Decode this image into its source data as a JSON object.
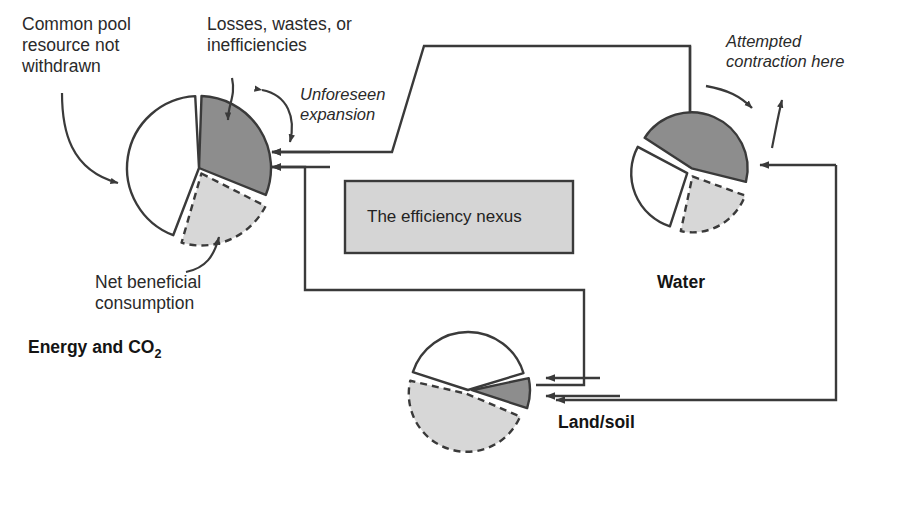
{
  "diagram": {
    "title_box": {
      "label": "The efficiency nexus"
    },
    "annotations": {
      "common_pool": "Common pool\nresource not\nwithdrawn",
      "losses": "Losses, wastes, or\ninefficiencies",
      "unforeseen": "Unforeseen\nexpansion",
      "net_beneficial": "Net beneficial\nconsumption",
      "attempted": "Attempted\ncontraction here"
    },
    "pies": [
      {
        "id": "energy",
        "label_main": "Energy and CO",
        "label_sub": "2",
        "center": [
          199,
          168
        ],
        "radius": 72,
        "slices": [
          {
            "name": "losses-wastes-inefficiencies",
            "fill": "#8d8d8d",
            "stroke": "solid",
            "start_deg": 2,
            "end_deg": 112,
            "explode": 0
          },
          {
            "name": "net-beneficial-consumption",
            "fill": "#d7d7d7",
            "stroke": "dashed",
            "start_deg": 117,
            "end_deg": 196,
            "explode": 6
          },
          {
            "name": "common-pool-not-withdrawn",
            "fill": "#ffffff",
            "stroke": "solid",
            "start_deg": 201,
            "end_deg": 357,
            "explode": 0
          }
        ]
      },
      {
        "id": "water",
        "label_main": "Water",
        "label_sub": "",
        "center": [
          690,
          172
        ],
        "radius": 56,
        "slices": [
          {
            "name": "losses-wastes-inefficiencies",
            "fill": "#8d8d8d",
            "stroke": "solid",
            "start_deg": 303,
            "end_deg": 104,
            "explode": 4
          },
          {
            "name": "net-beneficial-consumption",
            "fill": "#d7d7d7",
            "stroke": "dashed",
            "start_deg": 110,
            "end_deg": 192,
            "explode": 5
          },
          {
            "name": "common-pool-not-withdrawn",
            "fill": "#ffffff",
            "stroke": "solid",
            "start_deg": 198,
            "end_deg": 298,
            "explode": 3
          }
        ]
      },
      {
        "id": "land",
        "label_main": "Land/soil",
        "label_sub": "",
        "center": [
          468,
          390
        ],
        "radius": 58,
        "slices": [
          {
            "name": "losses-wastes-inefficiencies",
            "fill": "#8d8d8d",
            "stroke": "solid",
            "start_deg": 78,
            "end_deg": 108,
            "explode": 4
          },
          {
            "name": "net-beneficial-consumption",
            "fill": "#d7d7d7",
            "stroke": "dashed",
            "start_deg": 113,
            "end_deg": 283,
            "explode": 4
          },
          {
            "name": "common-pool-not-withdrawn",
            "fill": "#ffffff",
            "stroke": "solid",
            "start_deg": 288,
            "end_deg": 73,
            "explode": 0
          }
        ]
      }
    ],
    "colors": {
      "dark_slice": "#8d8d8d",
      "light_slice": "#d7d7d7",
      "white_slice": "#ffffff",
      "nexus_fill": "#d5d5d5",
      "line": "#3a3a3a",
      "text": "#2a2a2a"
    }
  }
}
